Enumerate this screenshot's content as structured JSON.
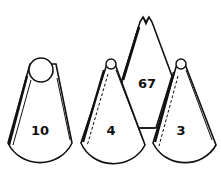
{
  "figure": {
    "tips": [
      {
        "label": "10",
        "shape": "round opening"
      },
      {
        "label": "4",
        "shape": "small round opening"
      },
      {
        "label": "67",
        "shape": "leaf opening"
      },
      {
        "label": "3",
        "shape": "small round opening"
      }
    ]
  },
  "colors": {
    "stroke": "#111111",
    "background": "#ffffff"
  }
}
